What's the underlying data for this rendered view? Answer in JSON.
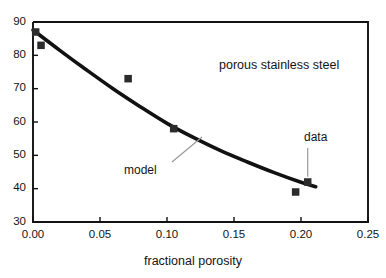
{
  "chart_data": {
    "type": "scatter",
    "title": "",
    "subtitle": "",
    "xlabel": "fractional porosity",
    "ylabel": "",
    "xlim": [
      0.0,
      0.25
    ],
    "ylim": [
      30,
      90
    ],
    "xticks": [
      "0.00",
      "0.05",
      "0.10",
      "0.15",
      "0.20",
      "0.25"
    ],
    "xtick_values": [
      0.0,
      0.05,
      0.1,
      0.15,
      0.2,
      0.25
    ],
    "yticks": [
      "30",
      "40",
      "50",
      "60",
      "70",
      "80",
      "90"
    ],
    "ytick_values": [
      30,
      40,
      50,
      60,
      70,
      80,
      90
    ],
    "grid": false,
    "legend_position": "none",
    "series": [
      {
        "name": "data",
        "type": "scatter",
        "marker": "square",
        "color": "#2b2b2b",
        "points": [
          {
            "x": 0.002,
            "y": 87.0
          },
          {
            "x": 0.006,
            "y": 83.0
          },
          {
            "x": 0.071,
            "y": 73.0
          },
          {
            "x": 0.105,
            "y": 58.0
          },
          {
            "x": 0.196,
            "y": 39.0
          },
          {
            "x": 0.205,
            "y": 42.0
          }
        ]
      },
      {
        "name": "model",
        "type": "line",
        "color": "#111111",
        "points": [
          {
            "x": 0.0,
            "y": 87.6
          },
          {
            "x": 0.02,
            "y": 81.5
          },
          {
            "x": 0.04,
            "y": 75.6
          },
          {
            "x": 0.06,
            "y": 69.9
          },
          {
            "x": 0.08,
            "y": 64.6
          },
          {
            "x": 0.1,
            "y": 59.6
          },
          {
            "x": 0.12,
            "y": 55.3
          },
          {
            "x": 0.14,
            "y": 51.4
          },
          {
            "x": 0.16,
            "y": 48.0
          },
          {
            "x": 0.18,
            "y": 44.8
          },
          {
            "x": 0.2,
            "y": 41.9
          },
          {
            "x": 0.211,
            "y": 40.6
          }
        ]
      }
    ],
    "annotations": [
      {
        "id": "sample-label",
        "text": "porous stainless steel",
        "x": 0.168,
        "y": 76.5,
        "leader": false
      },
      {
        "id": "model-label",
        "text": "model",
        "x": 0.083,
        "y": 47.5,
        "leader": true
      },
      {
        "id": "data-label",
        "text": "data",
        "x": 0.206,
        "y": 60.5,
        "leader": true
      }
    ]
  },
  "axes": {
    "x_title": "fractional porosity",
    "y_title": ""
  },
  "colors": {
    "axis": "#111111",
    "marker": "#2b2b2b",
    "curve": "#111111",
    "leader": "#9a9a9a",
    "background": "#ffffff",
    "text": "#141414"
  }
}
